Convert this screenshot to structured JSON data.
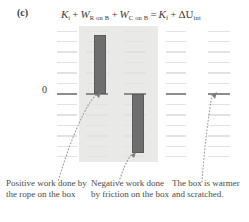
{
  "figure": {
    "panel_label": "(c)",
    "zero_label": "0"
  },
  "equation": {
    "t1": "K",
    "t1_sub": "i",
    "op1": "+",
    "t2": "W",
    "t2_sub": "R on B",
    "op2": "+",
    "t3": "W",
    "t3_sub": "C on B",
    "op3": "=",
    "t4": "K",
    "t4_sub": "f",
    "op4": "+",
    "t5": "ΔU",
    "t5_sub": "int"
  },
  "captions": [
    {
      "id": "positive-work-rope",
      "text": "Positive work done by the rope on the box"
    },
    {
      "id": "negative-work-friction",
      "text": "Negative work done by friction on the box"
    },
    {
      "id": "box-warmer-scratched",
      "text": "The box is warmer and scratched."
    }
  ],
  "chart_data": {
    "type": "bar",
    "categories": [
      "K_i",
      "W_R on B",
      "W_C on B",
      "K_f",
      "ΔU_int"
    ],
    "values": [
      0,
      5.6,
      -5.6,
      0,
      0
    ],
    "value_labels": [
      "0",
      "+5.6",
      "-5.6",
      "0",
      "0"
    ],
    "ylabel": "Energy",
    "xlabel": "",
    "ylim": [
      -6.5,
      6.5
    ],
    "grid": true,
    "gridlines": [
      6,
      5,
      4,
      3,
      2,
      1,
      0,
      -1,
      -2,
      -3,
      -4,
      -5,
      -6
    ],
    "zero_line": 0,
    "legend": "none",
    "bar_color": "#6e6e6e",
    "shaded_panel_color": "#e9e9e7",
    "gridline_color": "#e2e2e0",
    "zero_line_color": "#8d8d8d",
    "notes": [
      "Bar 2 (W_R on B) is positive, extending upward from zero.",
      "Bar 3 (W_C on B) is negative, extending downward from zero.",
      "K_i, K_f and ΔU_int bars have zero visible height."
    ]
  }
}
